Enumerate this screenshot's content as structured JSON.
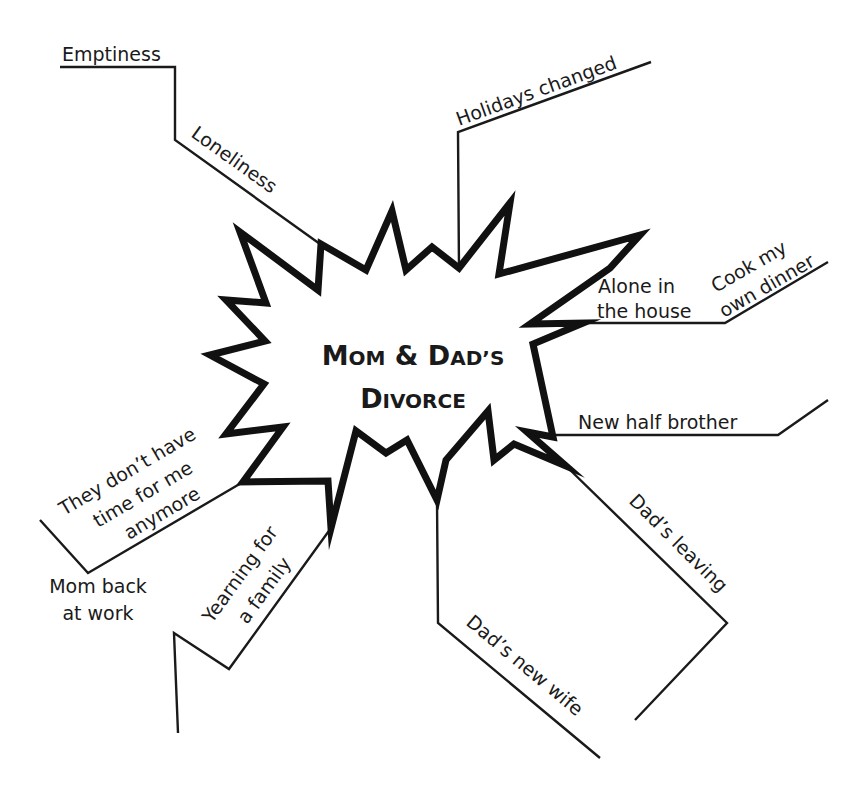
{
  "diagram": {
    "type": "mind-map",
    "center": {
      "line1": "Mom & Dad’s",
      "line1_parts": [
        "M",
        "OM",
        " & ",
        "D",
        "AD",
        "’S"
      ],
      "line2_parts": [
        "D",
        "IVORCE"
      ],
      "line2": "Divorce",
      "shape": "starburst"
    },
    "branches": [
      {
        "id": "loneliness",
        "label": "Loneliness",
        "sub": [
          {
            "label": "Emptiness"
          }
        ]
      },
      {
        "id": "holidays",
        "label": "Holidays changed"
      },
      {
        "id": "alone",
        "label_lines": [
          "Alone in",
          "the house"
        ],
        "sub": [
          {
            "label_lines": [
              "Cook my",
              "own dinner"
            ]
          }
        ]
      },
      {
        "id": "half-brother",
        "label": "New half brother"
      },
      {
        "id": "dads-leaving",
        "label": "Dad’s leaving"
      },
      {
        "id": "dads-new-wife",
        "label": "Dad’s new wife"
      },
      {
        "id": "yearning",
        "label_lines": [
          "Yearning for",
          "a family"
        ]
      },
      {
        "id": "no-time",
        "label_lines": [
          "They don’t have",
          "time for me",
          "anymore"
        ],
        "sub": [
          {
            "label_lines": [
              "Mom back",
              "at work"
            ]
          }
        ]
      }
    ],
    "colors": {
      "ink": "#1a1a1a",
      "background": "#ffffff"
    }
  }
}
